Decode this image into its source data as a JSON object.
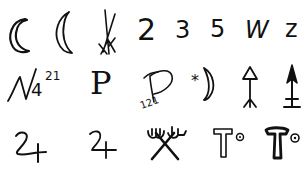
{
  "layout": {
    "rows": 3,
    "columns": 7,
    "background": "#ffffff",
    "ink": "#111111"
  },
  "symbols": {
    "row1": [
      {
        "name": "crescent-outline",
        "label": ""
      },
      {
        "name": "crescent-thin",
        "label": ""
      },
      {
        "name": "crossed-strokes",
        "label": ""
      },
      {
        "name": "digit-2",
        "label": "2"
      },
      {
        "name": "digit-3",
        "label": "3"
      },
      {
        "name": "digit-5",
        "label": "5"
      },
      {
        "name": "letter-w",
        "label": "W"
      },
      {
        "name": "letter-z",
        "label": "z"
      }
    ],
    "row2": [
      {
        "name": "n-glyph-with-numbers",
        "label": "4",
        "superscript": "21"
      },
      {
        "name": "serif-p",
        "label": "P"
      },
      {
        "name": "cursive-p-with-numbers",
        "label": "",
        "subscript": "121"
      },
      {
        "name": "star-crescent",
        "label": "*"
      },
      {
        "name": "arrow-triangle-forked",
        "label": ""
      },
      {
        "name": "arrow-double-bar",
        "label": ""
      }
    ],
    "row3": [
      {
        "name": "jupiter-cursive",
        "label": ""
      },
      {
        "name": "jupiter-plain",
        "label": ""
      },
      {
        "name": "crossed-tridents",
        "label": ""
      },
      {
        "name": "t-circle-outline",
        "label": "T"
      },
      {
        "name": "t-circle-bold",
        "label": "T"
      }
    ]
  },
  "text": {
    "two": "2",
    "three": "3",
    "five": "5",
    "w": "W",
    "z": "z",
    "four": "4",
    "n_sup": "21",
    "p_serif": "P",
    "p_sub": "121",
    "star": "*"
  }
}
